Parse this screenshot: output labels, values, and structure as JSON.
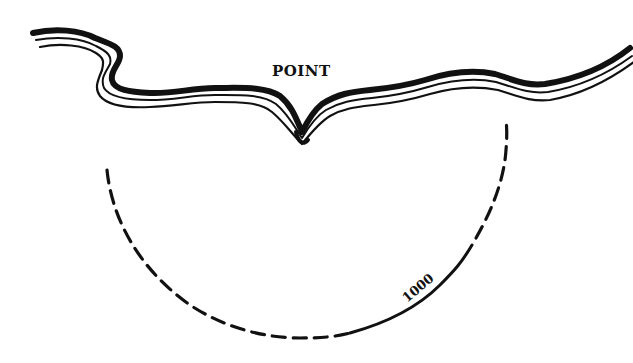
{
  "diagram": {
    "type": "coastline-depth-sketch",
    "colors": {
      "ink": "#111111",
      "background": "#ffffff"
    },
    "coastline": {
      "label": "POINT",
      "style": "triple parallel line, heavy outer stroke"
    },
    "contour": {
      "label": "1000",
      "style": "semicircular arc, dashed with solid lower-right segment"
    }
  }
}
